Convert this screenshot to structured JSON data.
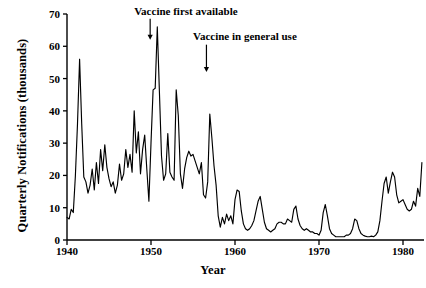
{
  "chart_data": {
    "type": "line",
    "title": "",
    "xlabel": "Year",
    "ylabel": "Quarterly Notifications (thousands)",
    "xlim": [
      1940,
      1982.5
    ],
    "ylim": [
      0,
      70
    ],
    "grid": false,
    "legend": "none",
    "xticks": [
      1940,
      1950,
      1960,
      1970,
      1980
    ],
    "xtick_labels": [
      "1940",
      "1950",
      "1960",
      "1970",
      "1980"
    ],
    "yticks": [
      0,
      10,
      20,
      30,
      40,
      50,
      60,
      70
    ],
    "ytick_labels": [
      "0",
      "10",
      "20",
      "30",
      "40",
      "50",
      "60",
      "70"
    ],
    "annotations": [
      {
        "text": "Vaccine first available",
        "text_x": 1948.0,
        "text_y": 70.5,
        "arrow_x": 1949.9,
        "arrow_from_y": 68.5,
        "arrow_to_y": 62.0
      },
      {
        "text": "Vaccine in general use",
        "text_x": 1955.0,
        "text_y": 63.0,
        "arrow_x": 1956.6,
        "arrow_from_y": 60.5,
        "arrow_to_y": 52.0
      }
    ],
    "series": [
      {
        "name": "Quarterly notifications",
        "x": [
          1940.0,
          1940.25,
          1940.5,
          1940.75,
          1941.0,
          1941.25,
          1941.5,
          1941.75,
          1942.0,
          1942.25,
          1942.5,
          1942.75,
          1943.0,
          1943.25,
          1943.5,
          1943.75,
          1944.0,
          1944.25,
          1944.5,
          1944.75,
          1945.0,
          1945.25,
          1945.5,
          1945.75,
          1946.0,
          1946.25,
          1946.5,
          1946.75,
          1947.0,
          1947.25,
          1947.5,
          1947.75,
          1948.0,
          1948.25,
          1948.5,
          1948.75,
          1949.0,
          1949.25,
          1949.5,
          1949.75,
          1950.0,
          1950.25,
          1950.5,
          1950.75,
          1951.0,
          1951.25,
          1951.5,
          1951.75,
          1952.0,
          1952.25,
          1952.5,
          1952.75,
          1953.0,
          1953.25,
          1953.5,
          1953.75,
          1954.0,
          1954.25,
          1954.5,
          1954.75,
          1955.0,
          1955.25,
          1955.5,
          1955.75,
          1956.0,
          1956.25,
          1956.5,
          1956.75,
          1957.0,
          1957.25,
          1957.5,
          1957.75,
          1958.0,
          1958.25,
          1958.5,
          1958.75,
          1959.0,
          1959.25,
          1959.5,
          1959.75,
          1960.0,
          1960.25,
          1960.5,
          1960.75,
          1961.0,
          1961.25,
          1961.5,
          1961.75,
          1962.0,
          1962.25,
          1962.5,
          1962.75,
          1963.0,
          1963.25,
          1963.5,
          1963.75,
          1964.0,
          1964.25,
          1964.5,
          1964.75,
          1965.0,
          1965.25,
          1965.5,
          1965.75,
          1966.0,
          1966.25,
          1966.5,
          1966.75,
          1967.0,
          1967.25,
          1967.5,
          1967.75,
          1968.0,
          1968.25,
          1968.5,
          1968.75,
          1969.0,
          1969.25,
          1969.5,
          1969.75,
          1970.0,
          1970.25,
          1970.5,
          1970.75,
          1971.0,
          1971.25,
          1971.5,
          1971.75,
          1972.0,
          1972.25,
          1972.5,
          1972.75,
          1973.0,
          1973.25,
          1973.5,
          1973.75,
          1974.0,
          1974.25,
          1974.5,
          1974.75,
          1975.0,
          1975.25,
          1975.5,
          1975.75,
          1976.0,
          1976.25,
          1976.5,
          1976.75,
          1977.0,
          1977.25,
          1977.5,
          1977.75,
          1978.0,
          1978.25,
          1978.5,
          1978.75,
          1979.0,
          1979.25,
          1979.5,
          1979.75,
          1980.0,
          1980.25,
          1980.5,
          1980.75,
          1981.0,
          1981.25,
          1981.5,
          1981.75,
          1982.0,
          1982.25
        ],
        "y": [
          7.0,
          6.5,
          9.5,
          8.5,
          20.0,
          36.0,
          56.0,
          36.0,
          19.5,
          18.0,
          14.5,
          17.0,
          22.0,
          15.5,
          24.0,
          17.5,
          28.0,
          21.5,
          29.5,
          22.5,
          19.0,
          16.5,
          18.0,
          14.5,
          17.0,
          23.5,
          18.5,
          20.5,
          28.0,
          22.5,
          26.5,
          21.0,
          40.0,
          27.0,
          33.5,
          20.5,
          28.0,
          32.5,
          22.0,
          12.0,
          30.0,
          46.5,
          47.0,
          66.0,
          46.0,
          26.0,
          18.5,
          20.5,
          33.0,
          21.0,
          19.5,
          18.5,
          46.5,
          38.5,
          20.5,
          16.0,
          22.0,
          25.5,
          27.5,
          26.0,
          26.5,
          24.5,
          22.5,
          20.5,
          24.0,
          14.0,
          13.0,
          18.0,
          39.0,
          31.5,
          23.0,
          17.0,
          7.5,
          4.0,
          7.0,
          5.0,
          8.0,
          6.0,
          7.5,
          5.0,
          12.5,
          15.5,
          15.0,
          9.0,
          5.0,
          3.5,
          3.0,
          3.5,
          4.5,
          6.0,
          9.0,
          12.0,
          13.5,
          9.5,
          5.5,
          3.5,
          3.0,
          2.5,
          3.0,
          3.5,
          5.0,
          5.5,
          5.5,
          5.0,
          5.0,
          6.5,
          6.0,
          5.5,
          9.5,
          10.5,
          6.5,
          4.5,
          3.5,
          3.0,
          3.5,
          3.0,
          2.5,
          2.5,
          2.0,
          2.0,
          1.5,
          3.0,
          8.5,
          11.0,
          7.5,
          3.5,
          2.0,
          1.5,
          1.0,
          1.0,
          1.0,
          1.0,
          1.0,
          1.5,
          1.5,
          2.0,
          3.5,
          6.5,
          6.0,
          3.5,
          2.0,
          1.5,
          1.2,
          1.0,
          1.0,
          1.2,
          1.0,
          1.5,
          2.5,
          6.0,
          12.0,
          17.5,
          19.5,
          14.5,
          18.0,
          21.0,
          19.5,
          14.0,
          11.5,
          12.0,
          12.5,
          11.0,
          9.5,
          9.0,
          9.5,
          12.0,
          10.5,
          16.0,
          13.5,
          24.0
        ]
      }
    ]
  },
  "axis": {
    "ylabel": "Quarterly Notifications (thousands)",
    "xlabel": "Year"
  }
}
